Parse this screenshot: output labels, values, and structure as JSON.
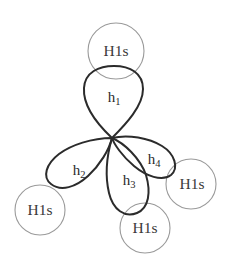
{
  "diagram": {
    "type": "orbital-overlap-diagram",
    "background_color": "#ffffff",
    "lobe_stroke_color": "#2b2b2b",
    "circle_stroke_color": "#9a9a9a",
    "label_color": "#3a3a3a",
    "central_node": {
      "x": 112,
      "y": 138
    },
    "hybrid_orbitals": [
      {
        "id": "h1",
        "label_base": "h",
        "label_sub": "1",
        "label_x": 114,
        "label_y": 99,
        "direction": "up"
      },
      {
        "id": "h2",
        "label_base": "h",
        "label_sub": "2",
        "label_x": 79,
        "label_y": 172,
        "direction": "down-left"
      },
      {
        "id": "h3",
        "label_base": "h",
        "label_sub": "3",
        "label_x": 129,
        "label_y": 182,
        "direction": "down"
      },
      {
        "id": "h4",
        "label_base": "h",
        "label_sub": "4",
        "label_x": 154,
        "label_y": 161,
        "direction": "right-down"
      }
    ],
    "hydrogen_orbitals": [
      {
        "id": "h1s-top",
        "label": "H1s",
        "cx": 116,
        "cy": 51,
        "r": 28,
        "label_x": 116,
        "label_y": 51
      },
      {
        "id": "h1s-bottom-left",
        "label": "H1s",
        "cx": 40,
        "cy": 210,
        "r": 25,
        "label_x": 40,
        "label_y": 211
      },
      {
        "id": "h1s-bottom",
        "label": "H1s",
        "cx": 145,
        "cy": 228,
        "r": 25,
        "label_x": 145,
        "label_y": 229
      },
      {
        "id": "h1s-right",
        "label": "H1s",
        "cx": 191,
        "cy": 184,
        "r": 25,
        "label_x": 192,
        "label_y": 185
      }
    ]
  }
}
